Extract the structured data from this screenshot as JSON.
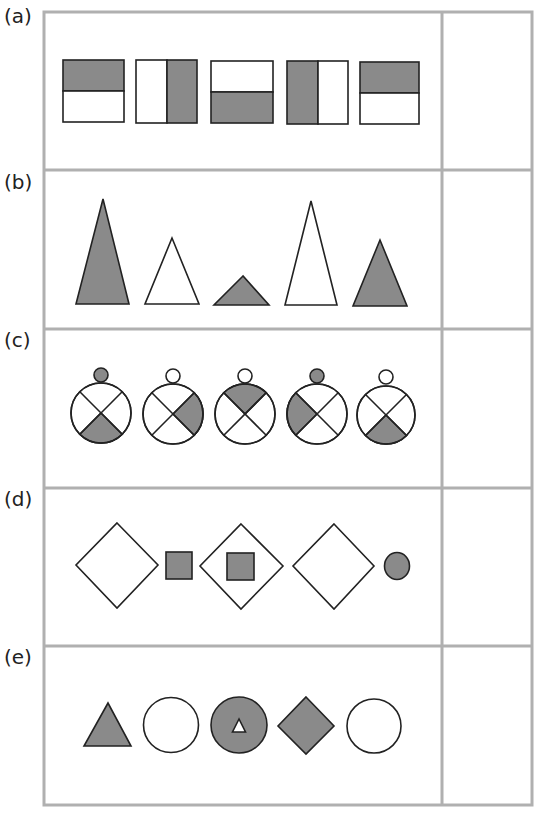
{
  "colors": {
    "fill": "#8a8a8a",
    "stroke": "#222222",
    "grid": "#b0b0b0",
    "blank": "#ffffff"
  },
  "rows": [
    {
      "label": "(a)",
      "name": "halved-squares",
      "items": [
        "top-shaded",
        "right-shaded",
        "bottom-shaded",
        "left-shaded",
        "top-shaded"
      ]
    },
    {
      "label": "(b)",
      "name": "triangles",
      "items": [
        "tall-shaded",
        "medium-white",
        "short-shaded",
        "tall-white",
        "medium-shaded"
      ]
    },
    {
      "label": "(c)",
      "name": "circles-with-quadrants",
      "items": [
        "knob-shaded bottom-shaded",
        "knob-white right-shaded",
        "knob-white top-shaded",
        "knob-shaded left-shaded",
        "knob-white bottom-shaded"
      ]
    },
    {
      "label": "(d)",
      "name": "diamonds-and-squares",
      "items": [
        "white-diamond",
        "shaded-square",
        "white-diamond with shaded-square",
        "white-diamond",
        "shaded-circle"
      ]
    },
    {
      "label": "(e)",
      "name": "mixed-shapes",
      "items": [
        "shaded-triangle",
        "white-circle",
        "shaded-circle with white-triangle",
        "shaded-diamond",
        "white-circle"
      ]
    }
  ],
  "answer_column": {
    "rows": 5,
    "content": ""
  }
}
